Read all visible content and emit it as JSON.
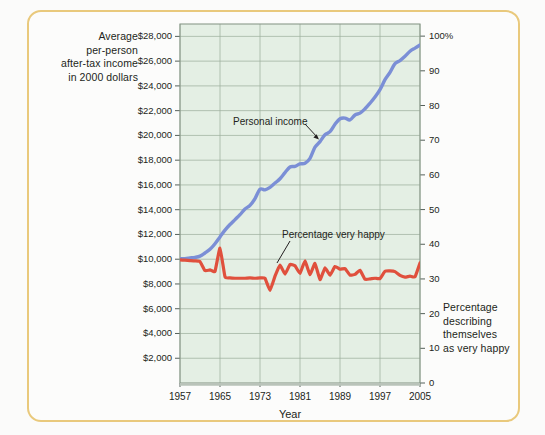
{
  "figure": {
    "background_color": "#fbfbfa",
    "frame_color": "#e9c97c"
  },
  "chart_data": {
    "type": "line",
    "title": "",
    "subtitle": "",
    "xlabel": "Year",
    "ylabel_left": "Average per-person after-tax income in 2000 dollars",
    "ylabel_right": "Percentage describing themselves as very happy",
    "plot_background": "#e4efe4",
    "grid": true,
    "legend_position": "inline-annotations",
    "x": [
      1957,
      1958,
      1959,
      1960,
      1961,
      1962,
      1963,
      1964,
      1965,
      1966,
      1967,
      1968,
      1969,
      1970,
      1971,
      1972,
      1973,
      1974,
      1975,
      1976,
      1977,
      1978,
      1979,
      1980,
      1981,
      1982,
      1983,
      1984,
      1985,
      1986,
      1987,
      1988,
      1989,
      1990,
      1991,
      1992,
      1993,
      1994,
      1995,
      1996,
      1997,
      1998,
      1999,
      2000,
      2001,
      2002,
      2003,
      2004,
      2005
    ],
    "xlim": [
      1957,
      2005
    ],
    "xticks": [
      1957,
      1965,
      1973,
      1981,
      1989,
      1997,
      2005
    ],
    "xticklabels": [
      "1957",
      "1965",
      "1973",
      "1981",
      "1989",
      "1997",
      "2005"
    ],
    "left_axis": {
      "label": "Average per-person after-tax income in 2000 dollars",
      "ylim": [
        0,
        29000
      ],
      "ticks": [
        2000,
        4000,
        6000,
        8000,
        10000,
        12000,
        14000,
        16000,
        18000,
        20000,
        22000,
        24000,
        26000,
        28000
      ],
      "ticklabels": [
        "$2,000",
        "$4,000",
        "$6,000",
        "$8,000",
        "$10,000",
        "$12,000",
        "$14,000",
        "$16,000",
        "$18,000",
        "$20,000",
        "$22,000",
        "$24,000",
        "$26,000",
        "$28,000"
      ]
    },
    "right_axis": {
      "label": "Percentage describing themselves as very happy",
      "ylim": [
        0,
        103.5
      ],
      "ticks": [
        0,
        10,
        20,
        30,
        40,
        50,
        60,
        70,
        80,
        90,
        100
      ],
      "ticklabels": [
        "0",
        "10",
        "20",
        "30",
        "40",
        "50",
        "60",
        "70",
        "80",
        "90",
        "100%"
      ]
    },
    "series": [
      {
        "name": "Personal income",
        "axis": "left",
        "color": "#7b8fd6",
        "annotation": "Personal income",
        "values": [
          10050,
          10050,
          10100,
          10150,
          10250,
          10500,
          10800,
          11250,
          11800,
          12350,
          12800,
          13200,
          13600,
          14050,
          14350,
          14900,
          15650,
          15600,
          15800,
          16150,
          16500,
          17000,
          17450,
          17500,
          17700,
          17750,
          18150,
          19050,
          19500,
          20050,
          20300,
          20900,
          21350,
          21400,
          21250,
          21650,
          21800,
          22150,
          22600,
          23100,
          23700,
          24500,
          25100,
          25800,
          26050,
          26400,
          26800,
          27050,
          27300
        ]
      },
      {
        "name": "Percentage very happy",
        "axis": "right",
        "color": "#e0503d",
        "annotation": "Percentage very happy",
        "values": [
          35.5,
          35.4,
          35.3,
          35.2,
          35.0,
          32.4,
          32.6,
          32.2,
          38.9,
          30.6,
          30.3,
          30.2,
          30.2,
          30.2,
          30.3,
          30.2,
          30.3,
          30.2,
          26.7,
          30.8,
          34.0,
          31.4,
          34.2,
          33.8,
          31.6,
          35.2,
          31.2,
          34.5,
          29.8,
          33.2,
          31.1,
          33.6,
          32.8,
          33.0,
          31.1,
          31.3,
          32.5,
          29.9,
          30.0,
          30.2,
          30.1,
          32.2,
          32.3,
          32.1,
          31.0,
          30.5,
          30.8,
          30.6,
          34.6
        ]
      }
    ]
  },
  "left_axis_title_lines": [
    "Average",
    "per-person",
    "after-tax income",
    "in 2000 dollars"
  ],
  "right_axis_title_lines": [
    "Percentage",
    "describing",
    "themselves",
    "as very happy"
  ],
  "x_axis_title": "Year",
  "annotations": {
    "personal_income": "Personal income",
    "very_happy": "Percentage very happy"
  }
}
